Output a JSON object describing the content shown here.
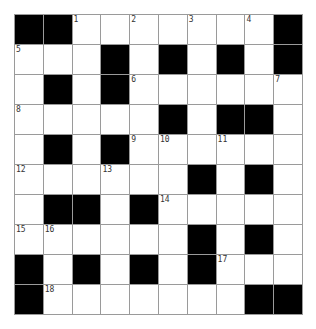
{
  "puzzle": {
    "rows": 10,
    "cols": 10,
    "colors": {
      "block": "#000000",
      "open": "#ffffff",
      "gridline": "#9a9a9a"
    },
    "grid": [
      [
        "#",
        "#",
        "1",
        ".",
        "2",
        ".",
        "3",
        ".",
        "4",
        "#"
      ],
      [
        "5",
        ".",
        ".",
        "#",
        ".",
        "#",
        ".",
        "#",
        ".",
        "#"
      ],
      [
        ".",
        "#",
        ".",
        "#",
        "6",
        ".",
        ".",
        ".",
        ".",
        "7"
      ],
      [
        "8",
        ".",
        ".",
        ".",
        ".",
        "#",
        ".",
        "#",
        "#",
        "."
      ],
      [
        ".",
        "#",
        ".",
        "#",
        "9",
        "10",
        ".",
        "11",
        ".",
        "."
      ],
      [
        "12",
        ".",
        ".",
        "13",
        ".",
        ".",
        "#",
        ".",
        "#",
        "."
      ],
      [
        ".",
        "#",
        "#",
        ".",
        "#",
        "14",
        ".",
        ".",
        ".",
        "."
      ],
      [
        "15",
        "16",
        ".",
        ".",
        ".",
        ".",
        "#",
        ".",
        "#",
        "."
      ],
      [
        "#",
        ".",
        "#",
        ".",
        "#",
        ".",
        "#",
        "17",
        ".",
        "."
      ],
      [
        "#",
        "18",
        ".",
        ".",
        ".",
        ".",
        ".",
        ".",
        "#",
        "#"
      ]
    ]
  }
}
